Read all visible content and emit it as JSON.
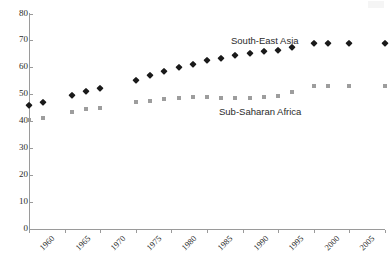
{
  "chart_data": {
    "type": "scatter",
    "title": "",
    "xlabel": "",
    "ylabel": "",
    "xlim": [
      1960,
      2010
    ],
    "ylim": [
      0,
      80
    ],
    "grid": false,
    "legend_position": "inline-annotation",
    "xticks": [
      "1960",
      "1965",
      "1970",
      "1975",
      "1980",
      "1985",
      "1990",
      "1995",
      "2000",
      "2005",
      "2010"
    ],
    "yticks": [
      "0",
      "10",
      "20",
      "30",
      "40",
      "50",
      "60",
      "70",
      "80"
    ],
    "series": [
      {
        "name": "South-East Asia",
        "marker": "diamond",
        "color": "#1a1a1a",
        "x": [
          1960,
          1962,
          1966,
          1968,
          1970,
          1975,
          1977,
          1979,
          1981,
          1983,
          1985,
          1987,
          1989,
          1991,
          1993,
          1995,
          1997,
          2000,
          2002,
          2005,
          2010
        ],
        "values": [
          45.9,
          47.0,
          49.8,
          51.4,
          52.4,
          55.4,
          57.3,
          58.5,
          60.2,
          61.3,
          62.6,
          63.5,
          64.6,
          65.2,
          66.1,
          66.6,
          67.7,
          69.2,
          69.2,
          69.2,
          69.2
        ]
      },
      {
        "name": "Sub-Saharan Africa",
        "marker": "square",
        "color": "#9d9d9d",
        "x": [
          1960,
          1962,
          1966,
          1968,
          1970,
          1975,
          1977,
          1979,
          1981,
          1983,
          1985,
          1987,
          1989,
          1991,
          1993,
          1995,
          1997,
          2000,
          2002,
          2005,
          2010
        ],
        "values": [
          40.4,
          41.2,
          43.3,
          44.4,
          45.1,
          47.0,
          47.7,
          48.4,
          48.7,
          48.9,
          48.9,
          48.8,
          48.7,
          48.7,
          48.9,
          49.5,
          50.8,
          53.2,
          53.2,
          53.2,
          53.2
        ]
      }
    ],
    "annotations": [
      {
        "text": "South-East Asia",
        "series": "South-East Asia"
      },
      {
        "text": "Sub-Saharan Africa",
        "series": "Sub-Saharan Africa"
      }
    ]
  }
}
